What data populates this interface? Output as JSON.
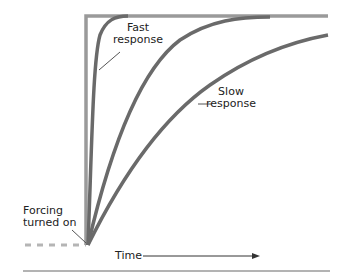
{
  "diagram": {
    "labels": {
      "fast_line1": "Fast",
      "fast_line2": "response",
      "slow_line1": "Slow",
      "slow_line2": "response",
      "forcing_line1": "Forcing",
      "forcing_line2": "turned on",
      "time": "Time"
    },
    "colors": {
      "forcing_step": "#9a9a9a",
      "response_curves": "#6a6a6a",
      "dashed_baseline": "#b5b5b5",
      "leader_lines": "#555555",
      "bottom_rule": "#9a9a9a",
      "text": "#222222"
    },
    "curves": [
      "forcing-step",
      "fast-response",
      "medium-response",
      "slow-response"
    ]
  }
}
